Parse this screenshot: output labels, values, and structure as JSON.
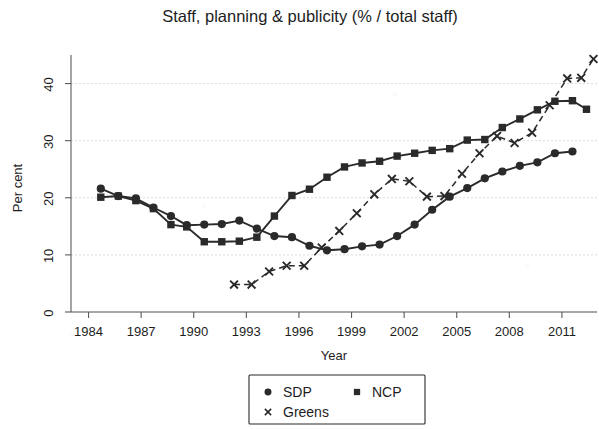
{
  "chart_data": {
    "type": "line",
    "title": "Staff, planning & publicity (% / total staff)",
    "xlabel": "Year",
    "ylabel": "Per cent",
    "xlim": [
      1983,
      2013
    ],
    "ylim": [
      0,
      45
    ],
    "xticks": [
      1984,
      1987,
      1990,
      1993,
      1996,
      1999,
      2002,
      2005,
      2008,
      2011
    ],
    "yticks": [
      0,
      10,
      20,
      30,
      40
    ],
    "grid": "horizontal-dashed",
    "legend_position": "bottom-center",
    "series": [
      {
        "name": "SDP",
        "marker": "circle",
        "linestyle": "solid",
        "color": "#2a2a2a",
        "points": [
          {
            "x": 1984.7,
            "y": 21.6
          },
          {
            "x": 1985.7,
            "y": 20.3
          },
          {
            "x": 1986.7,
            "y": 19.9
          },
          {
            "x": 1987.7,
            "y": 18.3
          },
          {
            "x": 1988.7,
            "y": 16.8
          },
          {
            "x": 1989.6,
            "y": 15.2
          },
          {
            "x": 1990.6,
            "y": 15.3
          },
          {
            "x": 1991.6,
            "y": 15.4
          },
          {
            "x": 1992.6,
            "y": 16.0
          },
          {
            "x": 1993.6,
            "y": 14.6
          },
          {
            "x": 1994.6,
            "y": 13.3
          },
          {
            "x": 1995.6,
            "y": 13.1
          },
          {
            "x": 1996.6,
            "y": 11.6
          },
          {
            "x": 1997.6,
            "y": 10.8
          },
          {
            "x": 1998.6,
            "y": 11.0
          },
          {
            "x": 1999.6,
            "y": 11.5
          },
          {
            "x": 2000.6,
            "y": 11.8
          },
          {
            "x": 2001.6,
            "y": 13.3
          },
          {
            "x": 2002.6,
            "y": 15.3
          },
          {
            "x": 2003.6,
            "y": 17.9
          },
          {
            "x": 2004.6,
            "y": 20.2
          },
          {
            "x": 2005.6,
            "y": 21.7
          },
          {
            "x": 2006.6,
            "y": 23.4
          },
          {
            "x": 2007.6,
            "y": 24.6
          },
          {
            "x": 2008.6,
            "y": 25.6
          },
          {
            "x": 2009.6,
            "y": 26.2
          },
          {
            "x": 2010.6,
            "y": 27.8
          },
          {
            "x": 2011.6,
            "y": 28.1
          }
        ]
      },
      {
        "name": "NCP",
        "marker": "square",
        "linestyle": "solid",
        "color": "#2a2a2a",
        "points": [
          {
            "x": 1984.7,
            "y": 20.1
          },
          {
            "x": 1985.7,
            "y": 20.3
          },
          {
            "x": 1986.7,
            "y": 19.5
          },
          {
            "x": 1987.7,
            "y": 18.1
          },
          {
            "x": 1988.7,
            "y": 15.3
          },
          {
            "x": 1989.6,
            "y": 14.9
          },
          {
            "x": 1990.6,
            "y": 12.3
          },
          {
            "x": 1991.6,
            "y": 12.3
          },
          {
            "x": 1992.6,
            "y": 12.4
          },
          {
            "x": 1993.6,
            "y": 13.1
          },
          {
            "x": 1994.6,
            "y": 16.8
          },
          {
            "x": 1995.6,
            "y": 20.4
          },
          {
            "x": 1996.6,
            "y": 21.5
          },
          {
            "x": 1997.6,
            "y": 23.6
          },
          {
            "x": 1998.6,
            "y": 25.4
          },
          {
            "x": 1999.6,
            "y": 26.1
          },
          {
            "x": 2000.6,
            "y": 26.4
          },
          {
            "x": 2001.6,
            "y": 27.3
          },
          {
            "x": 2002.6,
            "y": 27.8
          },
          {
            "x": 2003.6,
            "y": 28.3
          },
          {
            "x": 2004.6,
            "y": 28.6
          },
          {
            "x": 2005.6,
            "y": 30.1
          },
          {
            "x": 2006.6,
            "y": 30.2
          },
          {
            "x": 2007.6,
            "y": 32.3
          },
          {
            "x": 2008.6,
            "y": 33.8
          },
          {
            "x": 2009.6,
            "y": 35.4
          },
          {
            "x": 2010.6,
            "y": 36.9
          },
          {
            "x": 2011.6,
            "y": 37.0
          },
          {
            "x": 2012.4,
            "y": 35.5
          }
        ]
      },
      {
        "name": "Greens",
        "marker": "cross",
        "linestyle": "dashed",
        "color": "#2a2a2a",
        "points": [
          {
            "x": 1992.3,
            "y": 4.8
          },
          {
            "x": 1993.3,
            "y": 4.8
          },
          {
            "x": 1994.3,
            "y": 7.1
          },
          {
            "x": 1995.3,
            "y": 8.1
          },
          {
            "x": 1996.3,
            "y": 8.1
          },
          {
            "x": 1997.3,
            "y": 11.3
          },
          {
            "x": 1998.3,
            "y": 14.2
          },
          {
            "x": 1999.3,
            "y": 17.3
          },
          {
            "x": 2000.3,
            "y": 20.6
          },
          {
            "x": 2001.3,
            "y": 23.3
          },
          {
            "x": 2002.3,
            "y": 22.9
          },
          {
            "x": 2003.3,
            "y": 20.2
          },
          {
            "x": 2004.3,
            "y": 20.3
          },
          {
            "x": 2005.3,
            "y": 24.2
          },
          {
            "x": 2006.3,
            "y": 27.8
          },
          {
            "x": 2007.3,
            "y": 30.8
          },
          {
            "x": 2008.3,
            "y": 29.6
          },
          {
            "x": 2009.3,
            "y": 31.4
          },
          {
            "x": 2010.3,
            "y": 36.2
          },
          {
            "x": 2011.3,
            "y": 40.9
          },
          {
            "x": 2012.1,
            "y": 41.0
          },
          {
            "x": 2012.8,
            "y": 44.3
          }
        ]
      }
    ],
    "legend": [
      {
        "label": "SDP",
        "marker": "circle"
      },
      {
        "label": "NCP",
        "marker": "square"
      },
      {
        "label": "Greens",
        "marker": "cross"
      }
    ]
  }
}
